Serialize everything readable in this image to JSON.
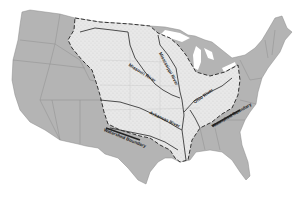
{
  "map": {
    "title": "",
    "subject": "Mississippi River Watershed",
    "colors": {
      "state_fill": "#b4b4b4",
      "watershed_fill": "#e6e6e6",
      "boundary": "#333333",
      "background": "#ffffff"
    },
    "labels": {
      "missouri": "Missouri River",
      "mississippi": "Mississippi River",
      "ohio": "Ohio River",
      "arkansas": "Arkansas River",
      "boundary_west": "Watershed Boundary",
      "boundary_east": "Watershed Boundary"
    }
  }
}
